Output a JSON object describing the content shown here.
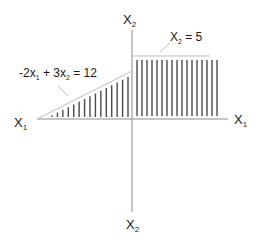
{
  "diagram": {
    "type": "feasible-region-graph",
    "colors": {
      "axis": "#8a8a8a",
      "constraint_line": "#bdbdbd",
      "hatch": "#4a4a4a",
      "text": "#1a1a1a",
      "leader": "#bdbdbd"
    },
    "axes": {
      "x_left_label": "X",
      "x_left_sub": "1",
      "x_right_label": "X",
      "x_right_sub": "1",
      "y_top_label": "X",
      "y_top_sub": "2",
      "y_bottom_label": "X",
      "y_bottom_sub": "2"
    },
    "constraints": [
      {
        "id": "slope",
        "prefix": "-2x",
        "sub1": "1",
        "mid": " + 3x",
        "sub2": "2",
        "suffix": " = 12"
      },
      {
        "id": "horizontal",
        "prefix": "X",
        "sub1": "2",
        "suffix": " = 5"
      }
    ],
    "hatching": {
      "right_region_lines": 17,
      "left_region_lines": 15
    }
  }
}
